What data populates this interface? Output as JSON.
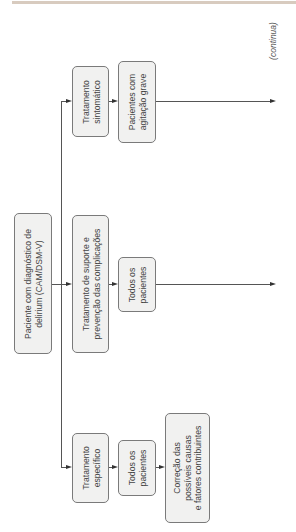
{
  "continuation_label": "(continua)",
  "nodes": {
    "root": "Paciente com diagnóstico de\ndelirium (CAM/DSM-V)",
    "symptomatic": "Tratamento\nsintomático",
    "symptomatic_patients": "Pacientes com\nagitação grave",
    "support": "Tratamento de suporte e\nprevenção das complicações",
    "support_patients": "Todos os\npacientes",
    "specific": "Tratamento\nespecífico",
    "specific_patients": "Todos os\npacientes",
    "specific_action": "Correção das\npossíveis causas\ne fatores contribuintes"
  },
  "colors": {
    "box_fill": "#f1f1f0",
    "box_border": "#7a7a7a",
    "line": "#555555",
    "text": "#444444",
    "top_rule": "#d8cbbf"
  }
}
